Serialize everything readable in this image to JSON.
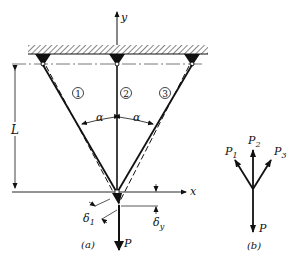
{
  "figure_a": {
    "caption": "(a)",
    "y_axis_label": "y",
    "x_axis_label": "x",
    "length_label": "L",
    "angle_left_label": "α",
    "angle_right_label": "α",
    "bar_labels": [
      "1",
      "2",
      "3"
    ],
    "delta1_label": "δ",
    "delta1_sub": "1",
    "deltay_label": "δ",
    "deltay_sub": "y",
    "load_label": "P"
  },
  "figure_b": {
    "caption": "(b)",
    "force_labels": [
      {
        "main": "P",
        "sub": "1"
      },
      {
        "main": "P",
        "sub": "2"
      },
      {
        "main": "P",
        "sub": "3"
      }
    ],
    "load_label": "P"
  },
  "colors": {
    "ink": "#111111",
    "background": "#ffffff"
  }
}
